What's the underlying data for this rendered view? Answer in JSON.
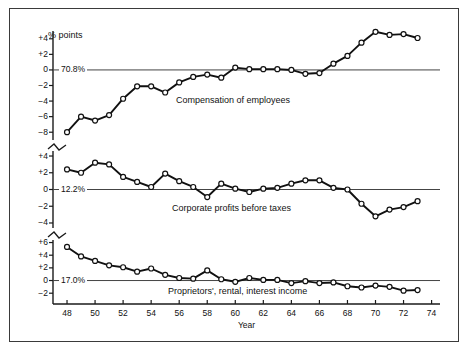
{
  "figure": {
    "unit_label": "% points",
    "x_axis_title": "Year"
  },
  "chart_data": {
    "type": "line",
    "title": "",
    "xlabel": "Year",
    "ylabel": "% points",
    "grid": false,
    "legend": "inline-annotations",
    "x": [
      48,
      49,
      50,
      51,
      52,
      53,
      54,
      55,
      56,
      57,
      58,
      59,
      60,
      61,
      62,
      63,
      64,
      65,
      66,
      67,
      68,
      69,
      70,
      71,
      72,
      73
    ],
    "x_tick_labels": [
      "48",
      "50",
      "52",
      "54",
      "56",
      "58",
      "60",
      "62",
      "64",
      "66",
      "68",
      "70",
      "72",
      "74"
    ],
    "x_ticks": [
      48,
      50,
      52,
      54,
      56,
      58,
      60,
      62,
      64,
      66,
      68,
      70,
      72,
      74
    ],
    "panels": [
      {
        "name": "compensation-of-employees",
        "label": "Compensation of employees",
        "baseline_label": "70.8%",
        "ylim": [
          -9,
          5
        ],
        "y_ticks": [
          4,
          2,
          0,
          -2,
          -4,
          -6,
          -8
        ],
        "y_tick_labels": [
          "+4",
          "+2",
          "0",
          "−2",
          "−4",
          "−6",
          "−8"
        ],
        "values": [
          -8.0,
          -6.0,
          -6.5,
          -5.8,
          -3.7,
          -2.1,
          -2.1,
          -2.9,
          -1.6,
          -0.9,
          -0.6,
          -1.0,
          0.3,
          0.1,
          0.1,
          0.1,
          0.0,
          -0.5,
          -0.4,
          0.8,
          1.8,
          3.5,
          4.9,
          4.5,
          4.6,
          4.1
        ]
      },
      {
        "name": "corporate-profits-before-taxes",
        "label": "Corporate profits before taxes",
        "baseline_label": "12.2%",
        "ylim": [
          -4.6,
          4.6
        ],
        "y_ticks": [
          4,
          2,
          0,
          -2,
          -4
        ],
        "y_tick_labels": [
          "+4",
          "+2",
          "0",
          "−2",
          "−4"
        ],
        "values": [
          2.4,
          2.0,
          3.2,
          3.0,
          1.5,
          0.9,
          0.3,
          1.9,
          1.0,
          0.3,
          -0.9,
          0.7,
          0.1,
          -0.3,
          0.1,
          0.2,
          0.7,
          1.1,
          1.1,
          0.2,
          0.0,
          -1.7,
          -3.2,
          -2.4,
          -2.1,
          -1.4
        ]
      },
      {
        "name": "proprietors-rental-interest-income",
        "label": "Proprietors', rental, interest income",
        "baseline_label": "17.0%",
        "ylim": [
          -2.6,
          6.4
        ],
        "y_ticks": [
          6,
          4,
          2,
          0,
          -2
        ],
        "y_tick_labels": [
          "+6",
          "+4",
          "+2",
          "0",
          "−2"
        ],
        "values": [
          5.3,
          3.8,
          3.1,
          2.4,
          2.1,
          1.4,
          1.9,
          0.9,
          0.4,
          0.3,
          1.6,
          0.2,
          -0.2,
          0.4,
          0.1,
          0.1,
          -0.4,
          -0.1,
          -0.4,
          -0.3,
          -0.9,
          -1.1,
          -0.8,
          -1.0,
          -1.6,
          -1.5
        ]
      }
    ]
  },
  "colors": {
    "line": "#111111",
    "marker_fill": "#ffffff",
    "axis": "#1a1a1a",
    "baseline": "#444444",
    "frame": "#3a3a3a"
  }
}
